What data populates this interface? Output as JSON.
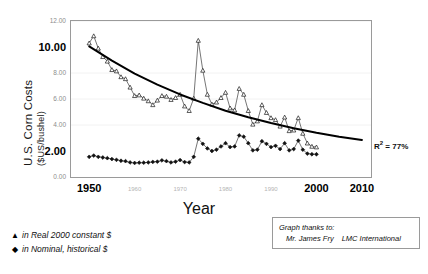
{
  "chart_data": {
    "type": "line",
    "title": "",
    "xlabel": "Year",
    "ylabel": "U.S. Corn Costs",
    "ylabel_sub": "($US/bushel)",
    "xlim": [
      1946,
      2012
    ],
    "ylim": [
      0,
      12
    ],
    "grid": false,
    "legend_position": "below-left",
    "annotations": [
      {
        "text_prefix": "R",
        "text_sup": "2",
        "text_suffix": " = 77%",
        "text": "R2 = 77%"
      }
    ],
    "xticks_major": [
      "1950",
      "2000",
      "2010"
    ],
    "xticks_minor": [
      "1960",
      "1970",
      "1980",
      "1990"
    ],
    "xticks_values_major": [
      1950,
      2000,
      2010
    ],
    "xticks_values_minor": [
      1960,
      1970,
      1980,
      1990
    ],
    "yticks_major": [
      "10.00",
      "2.00"
    ],
    "yticks_minor": [
      "12.00",
      "8.00",
      "6.00",
      "4.00",
      "0.00"
    ],
    "yticks_values_major": [
      10,
      2
    ],
    "yticks_values_minor": [
      12,
      8,
      6,
      4,
      0
    ],
    "series": [
      {
        "name": "in Real 2000 constant $",
        "marker": "triangle",
        "color": "#1a1a1a",
        "x": [
          1950,
          1951,
          1952,
          1953,
          1954,
          1955,
          1956,
          1957,
          1958,
          1959,
          1960,
          1961,
          1962,
          1963,
          1964,
          1965,
          1966,
          1967,
          1968,
          1969,
          1970,
          1971,
          1972,
          1973,
          1974,
          1975,
          1976,
          1977,
          1978,
          1979,
          1980,
          1981,
          1982,
          1983,
          1984,
          1985,
          1986,
          1987,
          1988,
          1989,
          1990,
          1991,
          1992,
          1993,
          1994,
          1995,
          1996,
          1997,
          1998,
          1999,
          2000
        ],
        "values": [
          10.3,
          10.85,
          9.9,
          9.25,
          8.9,
          8.25,
          8.15,
          7.7,
          7.55,
          6.9,
          6.25,
          6.3,
          6.05,
          5.85,
          5.55,
          5.9,
          6.25,
          6.2,
          5.95,
          6.1,
          6.35,
          5.45,
          5.1,
          6.05,
          10.5,
          8.2,
          6.35,
          5.6,
          5.75,
          6.1,
          6.5,
          5.3,
          5.15,
          6.8,
          6.35,
          5.1,
          4.05,
          4.3,
          5.55,
          4.95,
          4.55,
          4.4,
          3.9,
          4.6,
          3.55,
          3.6,
          4.55,
          3.35,
          2.6,
          2.35,
          2.3
        ]
      },
      {
        "name": "in Nominal, historical $",
        "marker": "diamond",
        "color": "#1a1a1a",
        "x": [
          1950,
          1951,
          1952,
          1953,
          1954,
          1955,
          1956,
          1957,
          1958,
          1959,
          1960,
          1961,
          1962,
          1963,
          1964,
          1965,
          1966,
          1967,
          1968,
          1969,
          1970,
          1971,
          1972,
          1973,
          1974,
          1975,
          1976,
          1977,
          1978,
          1979,
          1980,
          1981,
          1982,
          1983,
          1984,
          1985,
          1986,
          1987,
          1988,
          1989,
          1990,
          1991,
          1992,
          1993,
          1994,
          1995,
          1996,
          1997,
          1998,
          1999,
          2000
        ],
        "values": [
          1.55,
          1.65,
          1.55,
          1.5,
          1.45,
          1.38,
          1.32,
          1.25,
          1.22,
          1.12,
          1.08,
          1.1,
          1.1,
          1.12,
          1.16,
          1.18,
          1.28,
          1.22,
          1.12,
          1.18,
          1.3,
          1.15,
          1.12,
          1.55,
          2.95,
          2.55,
          2.2,
          2.0,
          2.1,
          2.35,
          2.6,
          2.3,
          2.35,
          3.2,
          3.1,
          2.6,
          2.05,
          2.1,
          2.75,
          2.55,
          2.3,
          2.4,
          2.15,
          2.6,
          2.05,
          2.15,
          2.8,
          2.1,
          1.8,
          1.75,
          1.75
        ]
      }
    ],
    "trend": {
      "name": "exponential-trendline",
      "x": [
        1950,
        1955,
        1960,
        1965,
        1970,
        1975,
        1980,
        1985,
        1990,
        1995,
        2000,
        2005,
        2010
      ],
      "values": [
        10.05,
        8.95,
        7.95,
        7.1,
        6.35,
        5.7,
        5.1,
        4.6,
        4.15,
        3.75,
        3.4,
        3.1,
        2.85
      ]
    }
  },
  "credit": {
    "line1": "Graph thanks to:",
    "line2_name": "Mr. James Fry",
    "line2_org": "LMC International"
  }
}
